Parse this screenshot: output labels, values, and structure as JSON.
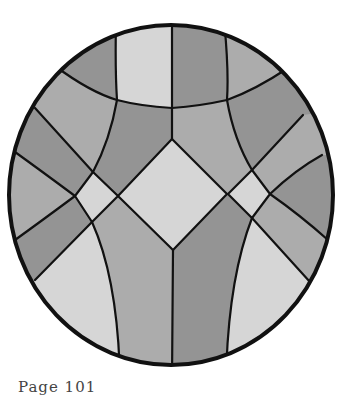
{
  "figure": {
    "colors": {
      "light": "#d6d6d6",
      "medium": "#acacac",
      "dark": "#949494",
      "outline": "#111111",
      "background": "#ffffff"
    }
  },
  "caption": {
    "text": "Page 101"
  }
}
